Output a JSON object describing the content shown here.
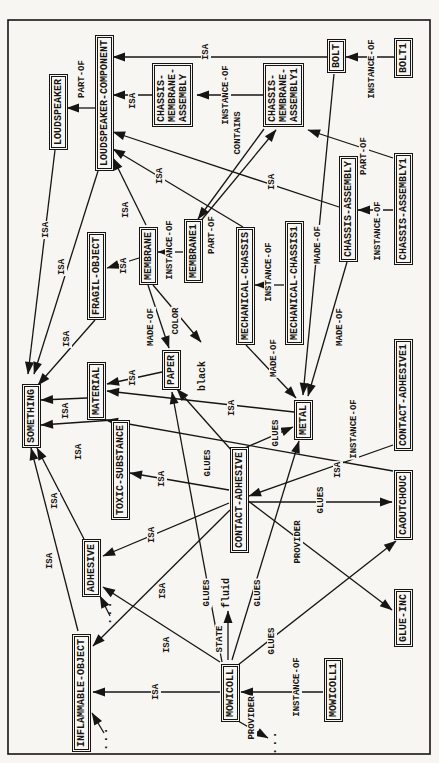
{
  "page": {
    "background": "#f7f6f2",
    "ink": "#171513"
  },
  "diagram": {
    "type": "semantic-network",
    "frame": {
      "x": 9,
      "y": 8,
      "w": 734,
      "h": 422
    },
    "relation_vocabulary": [
      "ISA",
      "INSTANCE-OF",
      "PART-OF",
      "MADE-OF",
      "CONTAINS",
      "COLOR",
      "GLUES",
      "PROVIDER",
      "STATE"
    ],
    "nodes": [
      {
        "id": "something",
        "label": "SOMETHING",
        "boxed": true,
        "x": 315,
        "y": 22
      },
      {
        "id": "loudspeaker",
        "label": "LOUDSPEAKER",
        "boxed": true,
        "x": 613,
        "y": 49
      },
      {
        "id": "loudspeaker-component",
        "label": "LOUDSPEAKER-COMPONENT",
        "boxed": true,
        "x": 592,
        "y": 95
      },
      {
        "id": "inflammable-object",
        "label": "INFLAMMABLE-OBJECT",
        "boxed": true,
        "x": 11,
        "y": 72
      },
      {
        "id": "adhesive",
        "label": "ADHESIVE",
        "boxed": true,
        "x": 166,
        "y": 82
      },
      {
        "id": "fragil-object",
        "label": "FRAGIL-OBJECT",
        "boxed": true,
        "x": 443,
        "y": 87
      },
      {
        "id": "material",
        "label": "MATERIAL",
        "boxed": true,
        "x": 343,
        "y": 87
      },
      {
        "id": "toxic-substance",
        "label": "TOXIC-SUBSTANCE",
        "boxed": true,
        "x": 243,
        "y": 111
      },
      {
        "id": "membrane",
        "label": "MEMBRANE",
        "boxed": true,
        "x": 478,
        "y": 139
      },
      {
        "id": "chassis-membrane-assembly",
        "label": "CHASSIS-\nMEMBRANE-\nASSEMBLY",
        "boxed": true,
        "x": 636,
        "y": 152
      },
      {
        "id": "paper",
        "label": "PAPER",
        "boxed": true,
        "x": 373,
        "y": 162
      },
      {
        "id": "membrane1",
        "label": "MEMBRANE1",
        "boxed": true,
        "x": 480,
        "y": 184
      },
      {
        "id": "black",
        "label": "black",
        "boxed": false,
        "x": 372,
        "y": 197
      },
      {
        "id": "fluid",
        "label": "fluid",
        "boxed": false,
        "x": 155,
        "y": 221
      },
      {
        "id": "mowicoll",
        "label": "MOWICOLL",
        "boxed": true,
        "x": 41,
        "y": 221
      },
      {
        "id": "contact-adhesive",
        "label": "CONTACT-ADHESIVE",
        "boxed": true,
        "x": 210,
        "y": 230
      },
      {
        "id": "mechanical-chassis",
        "label": "MECHANICAL-CHASSIS",
        "boxed": true,
        "x": 418,
        "y": 236
      },
      {
        "id": "chassis-membrane-assembly1",
        "label": "CHASSIS-\nMEMBRANE-\nASSEMBLY1",
        "boxed": true,
        "x": 636,
        "y": 263
      },
      {
        "id": "mechanical-chassis1",
        "label": "MECHANICAL-CHASSIS1",
        "boxed": true,
        "x": 418,
        "y": 285
      },
      {
        "id": "metal",
        "label": "METAL",
        "boxed": true,
        "x": 323,
        "y": 294
      },
      {
        "id": "mowicoll1",
        "label": "MOWICOLL1",
        "boxed": true,
        "x": 41,
        "y": 324
      },
      {
        "id": "bolt",
        "label": "BOLT",
        "boxed": true,
        "x": 690,
        "y": 327
      },
      {
        "id": "chassis-assembly",
        "label": "CHASSIS-ASSEMBLY",
        "boxed": true,
        "x": 501,
        "y": 339
      },
      {
        "id": "caoutchouc",
        "label": "CAOUTCHOUC",
        "boxed": true,
        "x": 223,
        "y": 394
      },
      {
        "id": "glue-inc",
        "label": "GLUE-INC",
        "boxed": true,
        "x": 116,
        "y": 394
      },
      {
        "id": "contact-adhesive1",
        "label": "CONTACT-ADHESIVE1",
        "boxed": true,
        "x": 312,
        "y": 394
      },
      {
        "id": "bolt1",
        "label": "BOLT1",
        "boxed": true,
        "x": 685,
        "y": 394
      },
      {
        "id": "chassis-assembly1",
        "label": "CHASSIS-ASSEMBLY1",
        "boxed": true,
        "x": 498,
        "y": 394
      },
      {
        "id": "dots-adhesive",
        "label": "...",
        "boxed": false,
        "dots": true,
        "x": 138,
        "y": 103
      },
      {
        "id": "dots-inflammable",
        "label": "...",
        "boxed": false,
        "dots": true,
        "x": 12,
        "y": 99
      },
      {
        "id": "dots-provider",
        "label": "...",
        "boxed": false,
        "dots": true,
        "x": 8,
        "y": 268
      }
    ],
    "edges": [
      {
        "from": "bolt1",
        "to": "bolt",
        "label": "INSTANCE-OF",
        "x1": 706,
        "y1": 394,
        "x2": 706,
        "y2": 346,
        "lx": 694,
        "ly": 372
      },
      {
        "from": "bolt",
        "to": "loudspeaker-component",
        "label": "ISA",
        "x1": 706,
        "y1": 327,
        "x2": 706,
        "y2": 113,
        "lx": 711,
        "ly": 206
      },
      {
        "from": "chassis-membrane-assembly",
        "to": "loudspeaker-component",
        "label": "ISA",
        "x1": 668,
        "y1": 152,
        "x2": 668,
        "y2": 113,
        "lx": 662,
        "ly": 133
      },
      {
        "from": "chassis-membrane-assembly1",
        "to": "chassis-membrane-assembly",
        "label": "INSTANCE-OF",
        "x1": 668,
        "y1": 263,
        "x2": 668,
        "y2": 197,
        "lx": 668,
        "ly": 226
      },
      {
        "from": "chassis-assembly",
        "to": "loudspeaker-component",
        "label": "ISA",
        "x1": 556,
        "y1": 339,
        "x2": 631,
        "y2": 113,
        "lx": 581,
        "ly": 272
      },
      {
        "from": "membrane",
        "to": "loudspeaker-component",
        "label": "ISA",
        "x1": 538,
        "y1": 146,
        "x2": 605,
        "y2": 113,
        "lx": 553,
        "ly": 126
      },
      {
        "from": "mechanical-chassis",
        "to": "loudspeaker-component",
        "label": "ISA",
        "x1": 536,
        "y1": 243,
        "x2": 614,
        "y2": 113,
        "lx": 587,
        "ly": 160
      },
      {
        "from": "loudspeaker-component",
        "to": "loudspeaker",
        "label": "PART-OF",
        "x1": 655,
        "y1": 95,
        "x2": 655,
        "y2": 67,
        "lx": 684,
        "ly": 82
      },
      {
        "from": "loudspeaker",
        "to": "something",
        "label": "ISA",
        "x1": 613,
        "y1": 55,
        "x2": 389,
        "y2": 28,
        "lx": 533,
        "ly": 46
      },
      {
        "from": "loudspeaker-component",
        "to": "something",
        "label": "ISA",
        "x1": 592,
        "y1": 98,
        "x2": 389,
        "y2": 34,
        "lx": 496,
        "ly": 62
      },
      {
        "from": "fragil-object",
        "to": "something",
        "label": "ISA",
        "x1": 443,
        "y1": 95,
        "x2": 378,
        "y2": 38,
        "lx": 424,
        "ly": 67
      },
      {
        "from": "material",
        "to": "something",
        "label": "ISA",
        "x1": 365,
        "y1": 87,
        "x2": 363,
        "y2": 41,
        "lx": 352,
        "ly": 66
      },
      {
        "from": "toxic-substance",
        "to": "something",
        "label": "ISA",
        "x1": 343,
        "y1": 113,
        "x2": 338,
        "y2": 41,
        "lx": 311,
        "ly": 79
      },
      {
        "from": "adhesive",
        "to": "something",
        "label": "ISA",
        "x1": 224,
        "y1": 84,
        "x2": 315,
        "y2": 37,
        "lx": 262,
        "ly": 55
      },
      {
        "from": "inflammable-object",
        "to": "something",
        "label": "ISA",
        "x1": 132,
        "y1": 78,
        "x2": 315,
        "y2": 31,
        "lx": 202,
        "ly": 50
      },
      {
        "from": "paper",
        "to": "material",
        "label": "ISA",
        "x1": 391,
        "y1": 162,
        "x2": 379,
        "y2": 107,
        "lx": 385,
        "ly": 133
      },
      {
        "from": "metal",
        "to": "material",
        "label": "ISA",
        "x1": 351,
        "y1": 294,
        "x2": 372,
        "y2": 107,
        "lx": 355,
        "ly": 232
      },
      {
        "from": "caoutchouc",
        "to": "material",
        "label": "ISA",
        "x1": 292,
        "y1": 393,
        "x2": 343,
        "y2": 106,
        "lx": 293,
        "ly": 338
      },
      {
        "from": "contact-adhesive",
        "to": "toxic-substance",
        "label": "ISA",
        "x1": 273,
        "y1": 229,
        "x2": 290,
        "y2": 130,
        "lx": 284,
        "ly": 162
      },
      {
        "from": "contact-adhesive",
        "to": "adhesive",
        "label": "ISA",
        "x1": 260,
        "y1": 229,
        "x2": 207,
        "y2": 103,
        "lx": 228,
        "ly": 152
      },
      {
        "from": "contact-adhesive",
        "to": "inflammable-object",
        "label": "ISA",
        "x1": 253,
        "y1": 230,
        "x2": 117,
        "y2": 93,
        "lx": 172,
        "ly": 163
      },
      {
        "from": "mowicoll",
        "to": "adhesive",
        "label": "ISA",
        "x1": 101,
        "y1": 220,
        "x2": 176,
        "y2": 103,
        "lx": 118,
        "ly": 167
      },
      {
        "from": "mowicoll",
        "to": "inflammable-object",
        "label": "ISA",
        "x1": 71,
        "y1": 220,
        "x2": 71,
        "y2": 93,
        "lx": 71,
        "ly": 156
      },
      {
        "from": "membrane1",
        "to": "membrane",
        "label": "INSTANCE-OF",
        "x1": 511,
        "y1": 183,
        "x2": 511,
        "y2": 158,
        "lx": 513,
        "ly": 170
      },
      {
        "from": "mechanical-chassis1",
        "to": "mechanical-chassis",
        "label": "INSTANCE-OF",
        "x1": 478,
        "y1": 284,
        "x2": 478,
        "y2": 255,
        "lx": 491,
        "ly": 269
      },
      {
        "from": "contact-adhesive1",
        "to": "contact-adhesive",
        "label": "INSTANCE-OF",
        "x1": 318,
        "y1": 393,
        "x2": 267,
        "y2": 249,
        "lx": 334,
        "ly": 354
      },
      {
        "from": "mowicoll1",
        "to": "mowicoll",
        "label": "INSTANCE-OF",
        "x1": 71,
        "y1": 323,
        "x2": 71,
        "y2": 241,
        "lx": 76,
        "ly": 297
      },
      {
        "from": "membrane1",
        "to": "chassis-membrane-assembly1",
        "label": "PART-OF",
        "x1": 540,
        "y1": 199,
        "x2": 633,
        "y2": 276,
        "lx": 528,
        "ly": 212
      },
      {
        "from": "chassis-assembly1",
        "to": "chassis-membrane-assembly1",
        "label": "PART-OF",
        "x1": 605,
        "y1": 393,
        "x2": 633,
        "y2": 308,
        "lx": 607,
        "ly": 364
      },
      {
        "from": "chassis-membrane-assembly1",
        "to": "membrane1",
        "label": "CONTAINS",
        "x1": 634,
        "y1": 264,
        "x2": 544,
        "y2": 198,
        "lx": 630,
        "ly": 238
      },
      {
        "from": "bolt",
        "to": "metal",
        "label": "MADE-OF",
        "x1": 689,
        "y1": 334,
        "x2": 368,
        "y2": 303,
        "lx": 518,
        "ly": 318
      },
      {
        "from": "chassis-assembly",
        "to": "metal",
        "label": "MADE-OF",
        "x1": 501,
        "y1": 347,
        "x2": 367,
        "y2": 308,
        "lx": 436,
        "ly": 340
      },
      {
        "from": "mechanical-chassis",
        "to": "metal",
        "label": "MADE-OF",
        "x1": 418,
        "y1": 246,
        "x2": 365,
        "y2": 296,
        "lx": 405,
        "ly": 274
      },
      {
        "from": "membrane",
        "to": "paper",
        "label": "MADE-OF",
        "x1": 478,
        "y1": 148,
        "x2": 415,
        "y2": 169,
        "lx": 436,
        "ly": 151
      },
      {
        "from": "membrane",
        "to": "black",
        "label": "COLOR",
        "x1": 478,
        "y1": 153,
        "x2": 421,
        "y2": 201,
        "lx": 442,
        "ly": 176
      },
      {
        "from": "contact-adhesive",
        "to": "paper",
        "label": "GLUES",
        "x1": 311,
        "y1": 233,
        "x2": 374,
        "y2": 177,
        "lx": 300,
        "ly": 208
      },
      {
        "from": "mowicoll",
        "to": "paper",
        "label": "GLUES",
        "x1": 101,
        "y1": 222,
        "x2": 371,
        "y2": 172,
        "lx": 170,
        "ly": 207
      },
      {
        "from": "contact-adhesive",
        "to": "metal",
        "label": "GLUES",
        "x1": 313,
        "y1": 240,
        "x2": 336,
        "y2": 293,
        "lx": 330,
        "ly": 276
      },
      {
        "from": "mowicoll",
        "to": "metal",
        "label": "GLUES",
        "x1": 103,
        "y1": 232,
        "x2": 322,
        "y2": 299,
        "lx": 170,
        "ly": 258
      },
      {
        "from": "contact-adhesive",
        "to": "caoutchouc",
        "label": "GLUES",
        "x1": 261,
        "y1": 247,
        "x2": 261,
        "y2": 392,
        "lx": 263,
        "ly": 321
      },
      {
        "from": "mowicoll",
        "to": "caoutchouc",
        "label": "GLUES",
        "x1": 98,
        "y1": 238,
        "x2": 222,
        "y2": 396,
        "lx": 122,
        "ly": 272
      },
      {
        "from": "contact-adhesive",
        "to": "glue-inc",
        "label": "PROVIDER",
        "x1": 263,
        "y1": 247,
        "x2": 153,
        "y2": 392,
        "lx": 221,
        "ly": 298
      },
      {
        "from": "mowicoll",
        "to": "dots-provider",
        "label": "PROVIDER",
        "x1": 42,
        "y1": 238,
        "x2": 25,
        "y2": 268,
        "lx": 45,
        "ly": 252
      },
      {
        "from": "mowicoll",
        "to": "fluid",
        "label": "STATE",
        "x1": 103,
        "y1": 228,
        "x2": 152,
        "y2": 228,
        "lx": 124,
        "ly": 220
      },
      {
        "from": "dots-adhesive",
        "to": "adhesive",
        "label": "",
        "x1": 147,
        "y1": 110,
        "x2": 167,
        "y2": 100,
        "lx": 0,
        "ly": 0
      },
      {
        "from": "dots-inflammable",
        "to": "inflammable-object",
        "label": "",
        "x1": 30,
        "y1": 104,
        "x2": 50,
        "y2": 92,
        "lx": 0,
        "ly": 0
      },
      {
        "from": "chassis-assembly1",
        "to": "chassis-assembly",
        "label": "INSTANCE-OF",
        "x1": 553,
        "y1": 393,
        "x2": 553,
        "y2": 358,
        "lx": 532,
        "ly": 378
      },
      {
        "from": "membrane",
        "to": "fragil-object",
        "label": "ISA",
        "x1": 505,
        "y1": 139,
        "x2": 495,
        "y2": 107,
        "lx": 497,
        "ly": 124
      }
    ]
  }
}
